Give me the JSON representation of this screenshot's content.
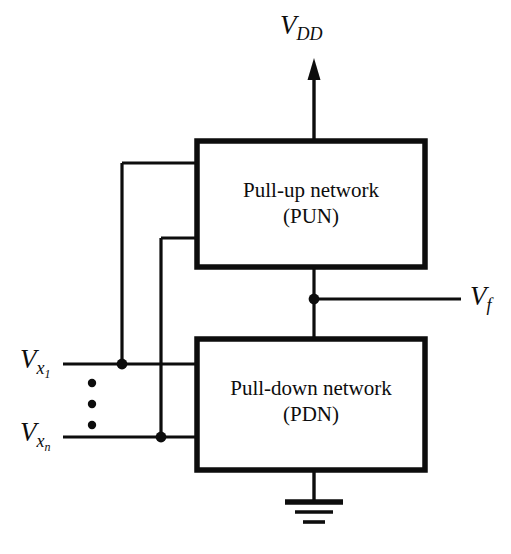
{
  "diagram": {
    "line_color": "#0d0d0d",
    "background": "#ffffff",
    "labels": {
      "vdd": {
        "base": "V",
        "sub": "DD",
        "text": "V_DD"
      },
      "vf": {
        "base": "V",
        "sub": "f",
        "text": "V_f"
      },
      "vx1": {
        "base": "V",
        "sub": "x",
        "subsub": "1",
        "text": "V_x1"
      },
      "vxn": {
        "base": "V",
        "sub": "x",
        "subsub": "n",
        "text": "V_xn"
      }
    },
    "blocks": [
      {
        "id": "pun",
        "line1": "Pull-up network",
        "line2": "(PUN)"
      },
      {
        "id": "pdn",
        "line1": "Pull-down network",
        "line2": "(PDN)"
      }
    ],
    "ellipsis": "vertical-dots",
    "ground": "earth-ground-symbol"
  }
}
